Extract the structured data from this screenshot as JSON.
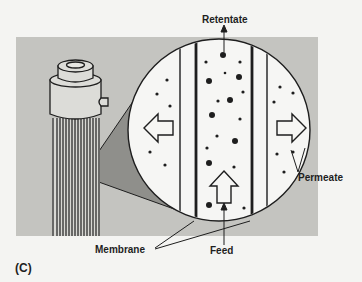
{
  "figure": {
    "panel_label": "(C)",
    "labels": {
      "retentate": "Retentate",
      "permeate": "Permeate",
      "membrane": "Membrane",
      "feed": "Feed"
    },
    "colors": {
      "panel_background": "#c4c4c0",
      "page_background": "#f4f4f2",
      "circle_fill": "#f6f6f4",
      "wedge_fill": "#8f8f8b",
      "ink": "#1e1e1e"
    }
  }
}
